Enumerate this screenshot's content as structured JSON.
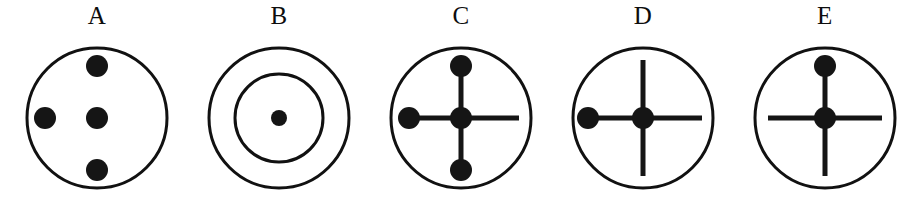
{
  "image": {
    "description": "Row of five labelled diagrams, each a black outlined circle containing dots and/or cross lines",
    "background_color": "#ffffff",
    "stroke_color": "#111111",
    "dot_color": "#151515",
    "panel_count": 5
  },
  "figures": [
    {
      "label": "A",
      "name": "figure-a",
      "outer_circle": true,
      "inner_circle": false,
      "cross_lines": false,
      "dots": [
        "center",
        "top",
        "left",
        "bottom"
      ],
      "description": "Circle with four separate filled dots: center, top, left and bottom. No connecting lines."
    },
    {
      "label": "B",
      "name": "figure-b",
      "outer_circle": true,
      "inner_circle": true,
      "cross_lines": false,
      "dots": [
        "center"
      ],
      "description": "Two concentric circles with a single small filled dot at the centre."
    },
    {
      "label": "C",
      "name": "figure-c",
      "outer_circle": true,
      "inner_circle": false,
      "cross_lines": true,
      "dots": [
        "center",
        "top",
        "left",
        "bottom"
      ],
      "description": "Circle with a cross of lines; filled dots at centre, top, left and bottom. The right arm is a bare line."
    },
    {
      "label": "D",
      "name": "figure-d",
      "outer_circle": true,
      "inner_circle": false,
      "cross_lines": true,
      "dots": [
        "center",
        "left"
      ],
      "description": "Circle with a cross of lines; filled dots only at the centre and the left arm."
    },
    {
      "label": "E",
      "name": "figure-e",
      "outer_circle": true,
      "inner_circle": false,
      "cross_lines": true,
      "dots": [
        "center",
        "top"
      ],
      "description": "Circle with a cross of lines; filled dots only at the centre and the top arm."
    }
  ],
  "geometry": {
    "outer_radius": 80,
    "inner_radius": 50,
    "dot_radius": 11,
    "small_dot_radius": 8,
    "arm_length": 58,
    "stroke_width": 3,
    "line_width": 5,
    "center_x": 87,
    "center_y": 90
  }
}
